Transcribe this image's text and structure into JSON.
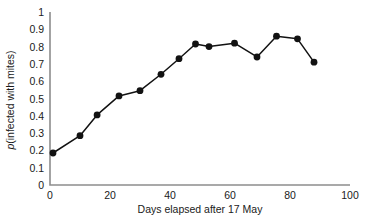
{
  "chart_data": {
    "type": "line",
    "title": "",
    "subtitle": "",
    "xlabel": "Days elapsed after 17 May",
    "ylabel": "p(infected with mites)",
    "ylabel_italic_prefix": "p",
    "ylabel_rest": "(infected with mites)",
    "xlim": [
      0,
      100
    ],
    "ylim": [
      0,
      1
    ],
    "xticks": [
      0,
      20,
      40,
      60,
      80,
      100
    ],
    "xtick_labels": [
      "0",
      "20",
      "40",
      "60",
      "80",
      "100"
    ],
    "yticks": [
      0,
      0.1,
      0.2,
      0.3,
      0.4,
      0.5,
      0.6,
      0.7,
      0.8,
      0.9,
      1
    ],
    "ytick_labels": [
      "0",
      "0.1",
      "0.2",
      "0.3",
      "0.4",
      "0.5",
      "0.6",
      "0.7",
      "0.8",
      "0.9",
      "1"
    ],
    "grid": false,
    "legend": false,
    "legend_position": "none",
    "marker": "filled-circle",
    "marker_color": "#121212",
    "line_color": "#121212",
    "axis_color": "#8d8d8d",
    "x": [
      1,
      10,
      15.7,
      23,
      30,
      37,
      43,
      48.5,
      53,
      61.5,
      69,
      75.5,
      82.5,
      88
    ],
    "y": [
      0.185,
      0.285,
      0.405,
      0.515,
      0.545,
      0.64,
      0.73,
      0.815,
      0.8,
      0.82,
      0.74,
      0.86,
      0.845,
      0.71
    ],
    "series": [
      {
        "name": "p(infected with mites)",
        "points": [
          {
            "x": 1,
            "y": 0.185
          },
          {
            "x": 10,
            "y": 0.285
          },
          {
            "x": 15.7,
            "y": 0.405
          },
          {
            "x": 23,
            "y": 0.515
          },
          {
            "x": 30,
            "y": 0.545
          },
          {
            "x": 37,
            "y": 0.64
          },
          {
            "x": 43,
            "y": 0.73
          },
          {
            "x": 48.5,
            "y": 0.815
          },
          {
            "x": 53,
            "y": 0.8
          },
          {
            "x": 61.5,
            "y": 0.82
          },
          {
            "x": 69,
            "y": 0.74
          },
          {
            "x": 75.5,
            "y": 0.86
          },
          {
            "x": 82.5,
            "y": 0.845
          },
          {
            "x": 88,
            "y": 0.71
          }
        ]
      }
    ]
  }
}
